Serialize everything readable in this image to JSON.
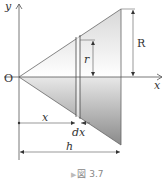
{
  "figure": {
    "caption_marker": "▶",
    "caption": "図 3.7",
    "labels": {
      "y_axis": "y",
      "x_axis": "x",
      "origin": "O",
      "big_radius": "R",
      "small_radius": "r",
      "distance": "x",
      "thickness": "dx",
      "height": "h"
    }
  }
}
